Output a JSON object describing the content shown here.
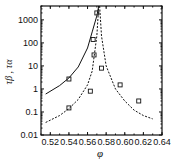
{
  "chart_data": {
    "type": "scatter",
    "title": "",
    "xlabel": "φ",
    "ylabel": "τβ , τα",
    "xlim": [
      0.51,
      0.64
    ],
    "ylim": [
      0.01,
      4000
    ],
    "yscale": "log",
    "grid": false,
    "xticks": [
      "0.52",
      "0.54",
      "0.56",
      "0.58",
      "0.60",
      "0.62",
      "0.64"
    ],
    "yticks": [
      "0.01",
      "0.1",
      "1",
      "10",
      "100",
      "1000"
    ],
    "series": [
      {
        "name": "tau_beta points",
        "marker": "square",
        "x": [
          0.54,
          0.566,
          0.57
        ],
        "y": [
          2.7,
          140,
          2000
        ]
      },
      {
        "name": "tau_alpha points",
        "marker": "square",
        "x": [
          0.54,
          0.563,
          0.567,
          0.575,
          0.595,
          0.615
        ],
        "y": [
          0.15,
          0.8,
          30,
          8,
          1.5,
          0.3
        ]
      },
      {
        "name": "tau_beta fit",
        "style": "solid",
        "x": [
          0.515,
          0.53,
          0.54,
          0.55,
          0.56,
          0.565,
          0.57,
          0.572
        ],
        "y": [
          0.6,
          1.4,
          3,
          9,
          60,
          300,
          1500,
          4000
        ]
      },
      {
        "name": "tau_alpha fit left",
        "style": "dashed",
        "x": [
          0.515,
          0.53,
          0.54,
          0.55,
          0.56,
          0.565,
          0.57,
          0.572
        ],
        "y": [
          0.035,
          0.07,
          0.14,
          0.35,
          1.5,
          6,
          200,
          4000
        ]
      },
      {
        "name": "tau_alpha fit right",
        "style": "dashed",
        "x": [
          0.573,
          0.575,
          0.58,
          0.59,
          0.6,
          0.61,
          0.62,
          0.63
        ],
        "y": [
          4000,
          200,
          10,
          1,
          0.3,
          0.12,
          0.07,
          0.05
        ]
      }
    ]
  }
}
